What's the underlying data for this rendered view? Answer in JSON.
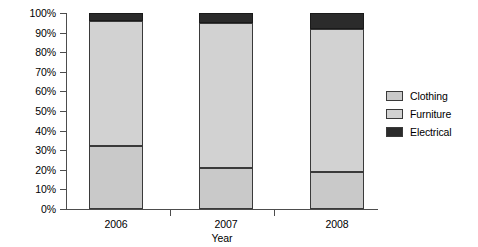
{
  "chart_data": {
    "type": "bar",
    "subtype": "stacked-percent-column",
    "title": "",
    "xlabel": "Year",
    "ylabel": "",
    "categories": [
      "2006",
      "2007",
      "2008"
    ],
    "series": [
      {
        "name": "Clothing",
        "color": "#c9c9c9",
        "values": [
          32,
          21,
          19
        ]
      },
      {
        "name": "Furniture",
        "color": "#d2d2d2",
        "values": [
          64,
          74,
          73
        ]
      },
      {
        "name": "Electrical",
        "color": "#2b2b2b",
        "values": [
          4,
          5,
          8
        ]
      }
    ],
    "cumulative_tops": {
      "2006": {
        "clothing": 32,
        "furniture": 96,
        "electrical": 100
      },
      "2007": {
        "clothing": 21,
        "furniture": 95,
        "electrical": 100
      },
      "2008": {
        "clothing": 19,
        "furniture": 92,
        "electrical": 100
      }
    },
    "ylim": [
      0,
      100
    ],
    "ytick_values": [
      0,
      10,
      20,
      30,
      40,
      50,
      60,
      70,
      80,
      90,
      100
    ],
    "ytick_labels": [
      "0%",
      "10%",
      "20%",
      "30%",
      "40%",
      "50%",
      "60%",
      "70%",
      "80%",
      "90%",
      "100%"
    ],
    "grid": false,
    "legend_position": "right"
  },
  "axes": {
    "y": {
      "ticks": [
        {
          "label": "100%",
          "value": 100
        },
        {
          "label": "90%",
          "value": 90
        },
        {
          "label": "80%",
          "value": 80
        },
        {
          "label": "70%",
          "value": 70
        },
        {
          "label": "60%",
          "value": 60
        },
        {
          "label": "50%",
          "value": 50
        },
        {
          "label": "40%",
          "value": 40
        },
        {
          "label": "30%",
          "value": 30
        },
        {
          "label": "20%",
          "value": 20
        },
        {
          "label": "10%",
          "value": 10
        },
        {
          "label": "0%",
          "value": 0
        }
      ]
    },
    "x": {
      "title": "Year",
      "ticks": [
        {
          "label": "2006"
        },
        {
          "label": "2007"
        },
        {
          "label": "2008"
        }
      ]
    }
  },
  "legend": {
    "items": [
      {
        "label": "Clothing",
        "color": "#c9c9c9"
      },
      {
        "label": "Furniture",
        "color": "#d2d2d2"
      },
      {
        "label": "Electrical",
        "color": "#2b2b2b"
      }
    ]
  }
}
